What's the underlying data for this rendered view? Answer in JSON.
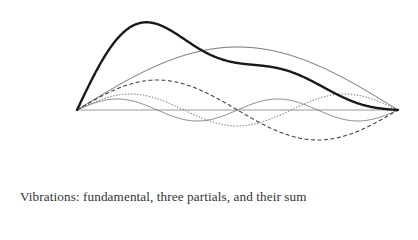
{
  "caption": "Vibrations: fundamental, three partials, and their sum",
  "colors": {
    "background": "#ffffff",
    "ink": "#222222",
    "axis": "#9a9a9a",
    "caption": "#333333"
  },
  "geometry": {
    "x_start": 77,
    "x_end": 398,
    "baseline_y": 110
  },
  "waves": [
    {
      "name": "fundamental",
      "harmonic": 1,
      "amplitude": 63,
      "style": "solid-thin",
      "stroke_width": 0.9,
      "dash": "",
      "color": "#555555"
    },
    {
      "name": "partial-2",
      "harmonic": 2,
      "amplitude": 30,
      "style": "dashed",
      "stroke_width": 1.1,
      "dash": "4,2.5",
      "color": "#444444"
    },
    {
      "name": "partial-3",
      "harmonic": 3,
      "amplitude": 16,
      "style": "dotted",
      "stroke_width": 1.0,
      "dash": "1.2,1.8",
      "color": "#555555"
    },
    {
      "name": "partial-4",
      "harmonic": 4,
      "amplitude": 11,
      "style": "solid-thin",
      "stroke_width": 0.8,
      "dash": "",
      "color": "#666666"
    }
  ],
  "sum": {
    "name": "sum",
    "style": "solid-bold",
    "stroke_width": 2.4,
    "color": "#1a1a1a"
  }
}
